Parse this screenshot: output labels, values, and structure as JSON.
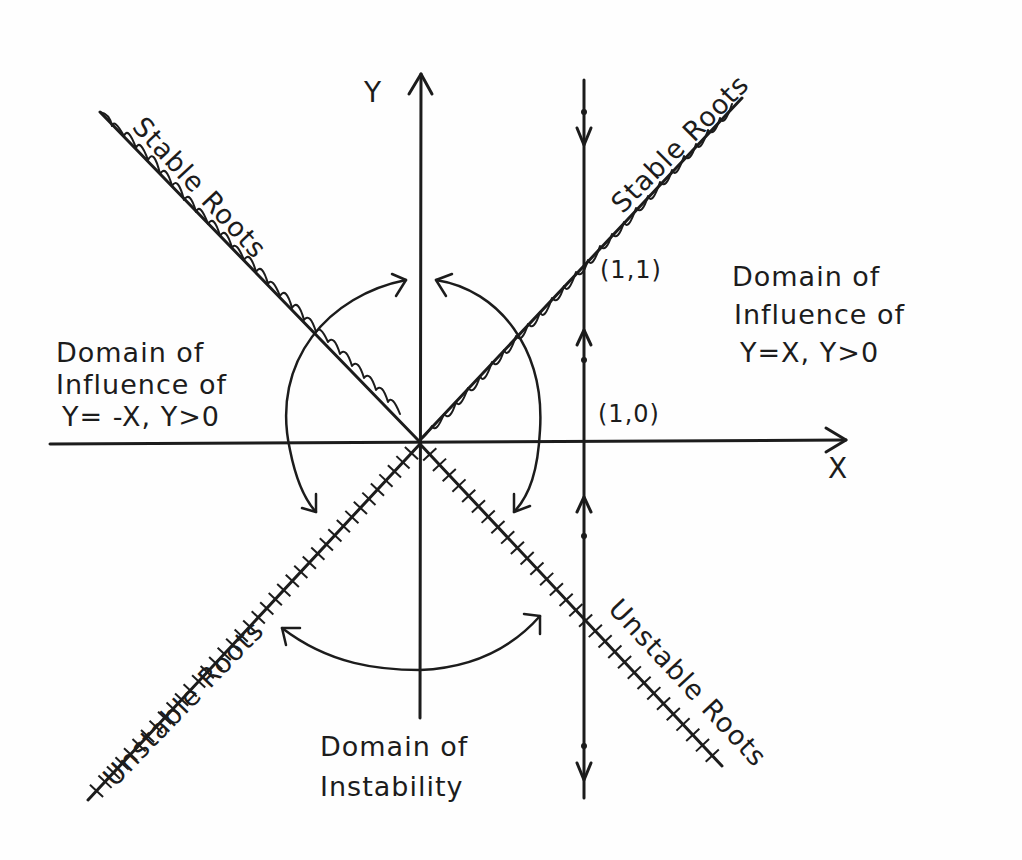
{
  "diagram": {
    "axes": {
      "x_label": "X",
      "y_label": "Y"
    },
    "lines": {
      "stable_upper_left": "Stable Roots",
      "stable_upper_right": "Stable Roots",
      "unstable_lower_left": "Unstable Roots",
      "unstable_lower_right": "Unstable Roots"
    },
    "points": {
      "p11": "(1,1)",
      "p10": "(1,0)"
    },
    "regions": {
      "left": {
        "line1": "Domain of",
        "line2": "Influence of",
        "line3": "Y= -X, Y>0"
      },
      "right": {
        "line1": "Domain of",
        "line2": "Influence of",
        "line3": "Y=X, Y>0"
      },
      "bottom": {
        "line1": "Domain of",
        "line2": "Instability"
      }
    },
    "colors": {
      "ink": "#1c1c1c",
      "paper": "#fefefe"
    }
  }
}
